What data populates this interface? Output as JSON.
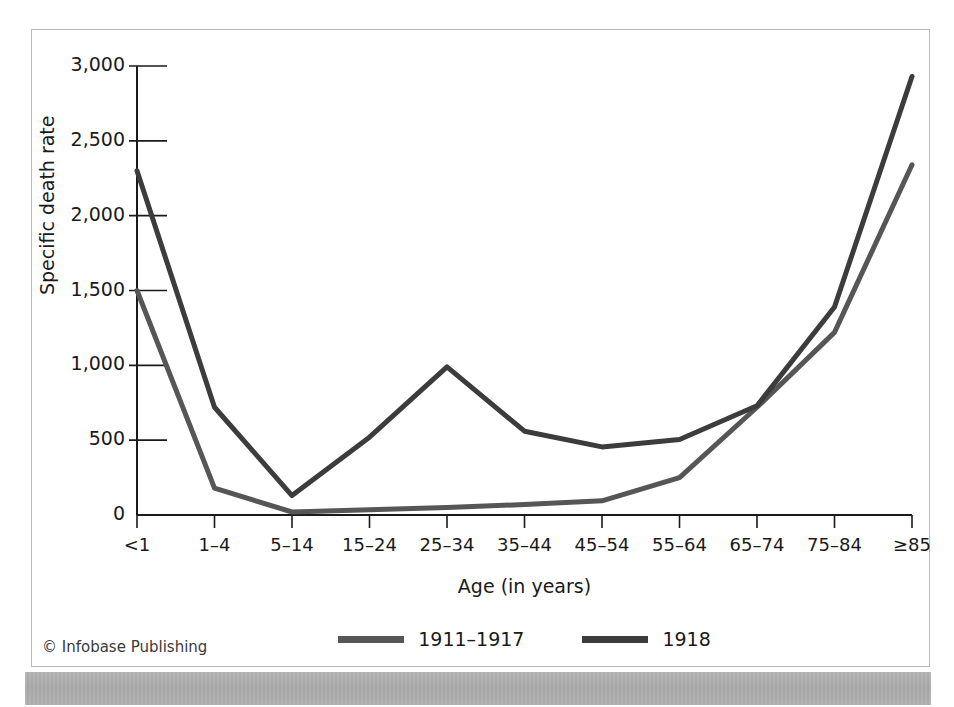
{
  "credit": "© Infobase Publishing",
  "legend": {
    "position": "bottom-center",
    "entries": [
      {
        "label": "1911–1917",
        "color": "#565656",
        "swatch_name": "legend-swatch-1911-1917"
      },
      {
        "label": "1918",
        "color": "#3c3c3c",
        "swatch_name": "legend-swatch-1918"
      }
    ]
  },
  "chart_data": {
    "type": "line",
    "title": "",
    "xlabel": "Age (in years)",
    "ylabel": "Specific death rate",
    "categories": [
      "<1",
      "1–4",
      "5–14",
      "15–24",
      "25–34",
      "35–44",
      "45–54",
      "55–64",
      "65–74",
      "75–84",
      "≥85"
    ],
    "ylim": [
      0,
      3000
    ],
    "yticks": [
      0,
      500,
      1000,
      1500,
      2000,
      2500,
      3000
    ],
    "ytick_labels": [
      "0",
      "500",
      "1,000",
      "1,500",
      "2,000",
      "2,500",
      "3,000"
    ],
    "grid": false,
    "series": [
      {
        "name": "1911–1917",
        "color": "#565656",
        "values": [
          1500,
          180,
          20,
          35,
          50,
          70,
          95,
          250,
          720,
          1220,
          2340
        ]
      },
      {
        "name": "1918",
        "color": "#3c3c3c",
        "values": [
          2300,
          720,
          130,
          520,
          990,
          560,
          455,
          505,
          730,
          1390,
          2930
        ]
      }
    ]
  }
}
